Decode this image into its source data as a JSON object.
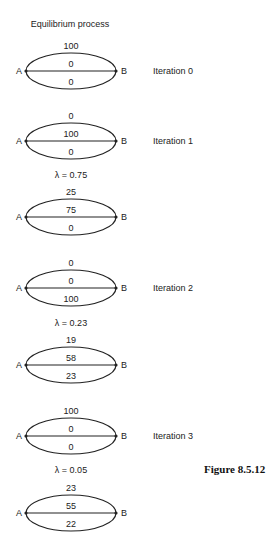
{
  "title": "Equilibrium process",
  "figure_label": "Figure 8.5.12",
  "node_labels": {
    "origin": "A",
    "destination": "B"
  },
  "diagrams": [
    {
      "id": "iter0",
      "iteration_label": "Iteration 0",
      "top": "100",
      "middle": "0",
      "bottom": "0",
      "cy": 71
    },
    {
      "id": "iter1",
      "iteration_label": "Iteration 1",
      "top": "0",
      "middle": "100",
      "bottom": "0",
      "cy": 141
    },
    {
      "id": "iter1-result",
      "lambda_label": "λ = 0.75",
      "top": "25",
      "middle": "75",
      "bottom": "0",
      "cy": 217
    },
    {
      "id": "iter2",
      "iteration_label": "Iteration 2",
      "top": "0",
      "middle": "0",
      "bottom": "100",
      "cy": 288
    },
    {
      "id": "iter2-result",
      "lambda_label": "λ = 0.23",
      "top": "19",
      "middle": "58",
      "bottom": "23",
      "cy": 365
    },
    {
      "id": "iter3",
      "iteration_label": "Iteration 3",
      "top": "100",
      "middle": "0",
      "bottom": "0",
      "cy": 436
    },
    {
      "id": "iter3-result",
      "lambda_label": "λ = 0.05",
      "top": "23",
      "middle": "55",
      "bottom": "22",
      "cy": 513
    }
  ],
  "lambdas": [
    {
      "label": "λ = 0.75",
      "y": 175
    },
    {
      "label": "λ = 0.23",
      "y": 323
    },
    {
      "label": "λ = 0.05",
      "y": 470
    }
  ]
}
